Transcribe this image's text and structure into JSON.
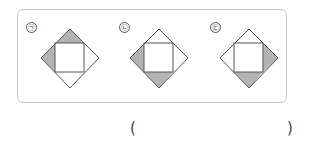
{
  "options": [
    {
      "label": "㉠",
      "shaded": [
        "top",
        "left"
      ]
    },
    {
      "label": "㉡",
      "shaded": [
        "left",
        "bottom"
      ]
    },
    {
      "label": "㉢",
      "shaded": [
        "right",
        "bottom"
      ]
    }
  ],
  "answer": {
    "open": "(",
    "close": ")"
  },
  "colors": {
    "shade": "#b3b3b3",
    "line": "#555555",
    "border": "#c8c8c8"
  }
}
